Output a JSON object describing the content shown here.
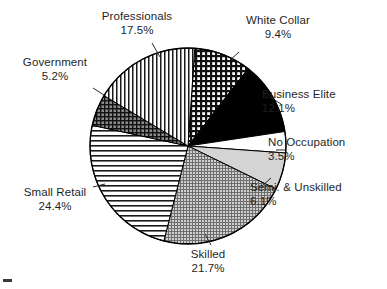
{
  "chart_data": {
    "type": "pie",
    "title": "",
    "subtitle": "",
    "xlabel": "",
    "ylabel": "",
    "legend_position": "none",
    "grid": false,
    "units": "percent",
    "start_angle_deg": 4,
    "direction": "clockwise",
    "categories": [
      "White Collar",
      "Business Elite",
      "No Occupation",
      "Semi. & Unskilled",
      "Skilled",
      "Small Retail",
      "Government",
      "Professionals"
    ],
    "values": [
      9.4,
      12.1,
      3.5,
      6.1,
      21.7,
      24.4,
      5.2,
      17.5
    ],
    "slices": [
      {
        "label": "White Collar",
        "value": 9.4,
        "value_label": "9.4%",
        "fill": "cross-hatch-dense",
        "color": "#2b2b2b"
      },
      {
        "label": "Business Elite",
        "value": 12.1,
        "value_label": "12.1%",
        "fill": "solid-black",
        "color": "#000000"
      },
      {
        "label": "No Occupation",
        "value": 3.5,
        "value_label": "3.5%",
        "fill": "solid-white",
        "color": "#ffffff"
      },
      {
        "label": "Semi. & Unskilled",
        "value": 6.1,
        "value_label": "6.1%",
        "fill": "solid-light-gray",
        "color": "#d0d0d0"
      },
      {
        "label": "Skilled",
        "value": 21.7,
        "value_label": "21.7%",
        "fill": "fine-grid-gray",
        "color": "#9a9a9a"
      },
      {
        "label": "Small Retail",
        "value": 24.4,
        "value_label": "24.4%",
        "fill": "horizontal-lines",
        "color": "#1a1a1a"
      },
      {
        "label": "Government",
        "value": 5.2,
        "value_label": "5.2%",
        "fill": "cross-hatch-dark",
        "color": "#4a4a4a"
      },
      {
        "label": "Professionals",
        "value": 17.5,
        "value_label": "17.5%",
        "fill": "vertical-lines",
        "color": "#1a1a1a"
      }
    ]
  },
  "labels": {
    "professionals": {
      "name": "Professionals",
      "pct": "17.5%"
    },
    "white_collar": {
      "name": "White Collar",
      "pct": "9.4%"
    },
    "government": {
      "name": "Government",
      "pct": "5.2%"
    },
    "business_elite": {
      "name": "Business Elite",
      "pct": "12.1%"
    },
    "no_occupation": {
      "name": "No Occupation",
      "pct": "3.5%"
    },
    "semi_unskilled": {
      "name": "Semi. & Unskilled",
      "pct": "6.1%"
    },
    "small_retail": {
      "name": "Small Retail",
      "pct": "24.4%"
    },
    "skilled": {
      "name": "Skilled",
      "pct": "21.7%"
    }
  }
}
